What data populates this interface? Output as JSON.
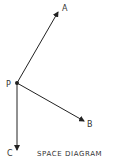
{
  "diagram": {
    "title": "SPACE DIAGRAM",
    "origin": {
      "label": "P",
      "x": 17,
      "y": 83
    },
    "vectors": [
      {
        "label": "A",
        "to_x": 58,
        "to_y": 12,
        "label_x": 63,
        "label_y": 10
      },
      {
        "label": "B",
        "to_x": 84,
        "to_y": 121,
        "label_x": 88,
        "label_y": 126
      },
      {
        "label": "C",
        "to_x": 17,
        "to_y": 150,
        "label_x": 8,
        "label_y": 156
      }
    ],
    "colors": {
      "line": "#222222",
      "text": "#333333"
    }
  }
}
